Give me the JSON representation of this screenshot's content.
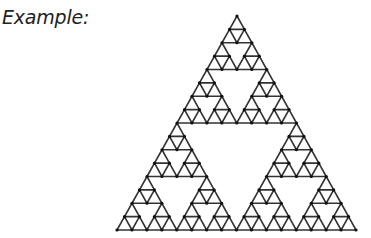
{
  "caption": "Example:",
  "figure": {
    "type": "sierpinski-triangle",
    "depth": 4,
    "apex": [
      237,
      16
    ],
    "base_left": [
      117,
      230
    ],
    "base_right": [
      356,
      230
    ],
    "stroke_color": "#333333",
    "dot_color": "#111111"
  }
}
